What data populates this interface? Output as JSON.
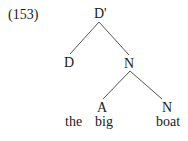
{
  "example": {
    "number": "(153)"
  },
  "tree": {
    "root": {
      "label": "D'"
    },
    "left_child": {
      "label": "D"
    },
    "right_child": {
      "label": "N"
    },
    "n_left_child": {
      "label": "A"
    },
    "n_right_child": {
      "label": "N"
    }
  },
  "words": {
    "w1": "the",
    "w2": "big",
    "w3": "boat"
  },
  "colors": {
    "text": "#1a1a1a",
    "lines": "#555555",
    "background": "#ffffff"
  }
}
